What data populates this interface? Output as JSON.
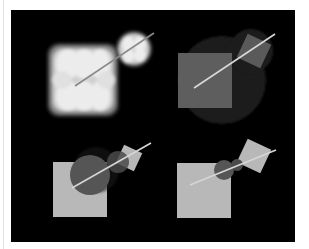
{
  "figure": {
    "background": "#000000",
    "panels": [
      {
        "id": "top-left",
        "description": "Swept volume of square along line (blurred soft cross shapes)",
        "line": {
          "x1": 75,
          "y1": 86,
          "x2": 154,
          "y2": 33,
          "color": "#8a8a8a"
        },
        "start_blob": {
          "x": 48,
          "y": 44,
          "w": 70,
          "h": 72,
          "color": "#e6e6e6"
        },
        "end_blob": {
          "cx": 135,
          "cy": 48,
          "r": 17,
          "color": "#e6e6e6"
        }
      },
      {
        "id": "top-right",
        "description": "Square with bounding circle, rotated square at end",
        "big_circle": {
          "cx": 222,
          "cy": 80,
          "r": 44,
          "color": "#1c1c1c"
        },
        "square": {
          "x": 178,
          "y": 53,
          "w": 54,
          "h": 55,
          "color": "#5e5e5e"
        },
        "small_circle": {
          "cx": 251,
          "cy": 51,
          "r": 22,
          "color": "#1e1e1e"
        },
        "rotated_square": {
          "cx": 254,
          "cy": 51,
          "size": 26,
          "angle": 25,
          "color": "#5a5a5a"
        },
        "line": {
          "x1": 194,
          "y1": 88,
          "x2": 275,
          "y2": 34,
          "color": "#d9d9d9"
        }
      },
      {
        "id": "bottom-left",
        "description": "Light square with dark circle overlap, rotated square at end",
        "square": {
          "x": 53,
          "y": 162,
          "w": 54,
          "h": 55,
          "color": "#b8b8b8"
        },
        "circle": {
          "cx": 90,
          "cy": 175,
          "r": 20,
          "color": "#555555"
        },
        "small_circle": {
          "cx": 118,
          "cy": 162,
          "r": 12,
          "color": "#4a4a4a"
        },
        "rotated_square": {
          "cx": 129,
          "cy": 158,
          "size": 20,
          "angle": 25,
          "color": "#b8b8b8"
        },
        "line": {
          "x1": 72,
          "y1": 188,
          "x2": 151,
          "y2": 143,
          "color": "#d6d6d6"
        }
      },
      {
        "id": "bottom-right",
        "description": "Light square with small dark circle, rotated square at end",
        "square": {
          "x": 177,
          "y": 163,
          "w": 54,
          "h": 55,
          "color": "#b8b8b8"
        },
        "circle": {
          "cx": 224,
          "cy": 170,
          "r": 10,
          "color": "#555555"
        },
        "small_circle": {
          "cx": 238,
          "cy": 164,
          "r": 6,
          "color": "#4a4a4a"
        },
        "rotated_square": {
          "cx": 254,
          "cy": 156,
          "size": 26,
          "angle": 25,
          "color": "#b8b8b8"
        },
        "line": {
          "x1": 190,
          "y1": 185,
          "x2": 276,
          "y2": 150,
          "color": "#d6d6d6"
        }
      }
    ]
  }
}
